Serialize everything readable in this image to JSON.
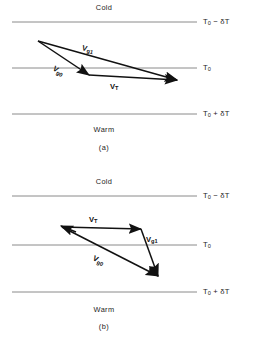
{
  "figure": {
    "panels": [
      {
        "id": "a",
        "caption": "(a)",
        "top_region_label": "Cold",
        "bottom_region_label": "Warm",
        "isotherms": [
          {
            "name": "cold-isotherm",
            "label_base": "T",
            "label_sub": "0",
            "label_suffix": " − δT",
            "y": 22
          },
          {
            "name": "middle-isotherm",
            "label_base": "T",
            "label_sub": "0",
            "label_suffix": "",
            "y": 68
          },
          {
            "name": "warm-isotherm",
            "label_base": "T",
            "label_sub": "0",
            "label_suffix": " + δT",
            "y": 114
          }
        ],
        "vectors": [
          {
            "name": "vg1",
            "label_base": "V",
            "label_sub": "g1",
            "x1": 38,
            "y1": 41,
            "x2": 177,
            "y2": 80
          },
          {
            "name": "vg0",
            "label_base": "V",
            "label_sub": "g0",
            "x1": 38,
            "y1": 41,
            "x2": 89,
            "y2": 75
          },
          {
            "name": "vt",
            "label_base": "V",
            "label_sub": "T",
            "x1": 89,
            "y1": 75,
            "x2": 177,
            "y2": 80
          }
        ]
      },
      {
        "id": "b",
        "caption": "(b)",
        "top_region_label": "Cold",
        "bottom_region_label": "Warm",
        "isotherms": [
          {
            "name": "cold-isotherm",
            "label_base": "T",
            "label_sub": "0",
            "label_suffix": " − δT",
            "y": 196
          },
          {
            "name": "middle-isotherm",
            "label_base": "T",
            "label_sub": "0",
            "label_suffix": "",
            "y": 245
          },
          {
            "name": "warm-isotherm",
            "label_base": "T",
            "label_sub": "0",
            "label_suffix": " + δT",
            "y": 292
          }
        ],
        "vectors": [
          {
            "name": "vt",
            "label_base": "V",
            "label_sub": "T",
            "x1": 62,
            "y1": 227,
            "x2": 141,
            "y2": 229
          },
          {
            "name": "vg1",
            "label_base": "V",
            "label_sub": "g1",
            "x1": 141,
            "y1": 229,
            "x2": 158,
            "y2": 276
          },
          {
            "name": "vg0",
            "label_base": "V",
            "label_sub": "g0",
            "x1": 62,
            "y1": 227,
            "x2": 158,
            "y2": 276
          }
        ]
      }
    ],
    "style": {
      "isotherm_color": "#8a8a8a",
      "vector_color": "#111111",
      "background": "#ffffff",
      "isotherm_x_start": 12,
      "isotherm_x_end": 197
    }
  }
}
